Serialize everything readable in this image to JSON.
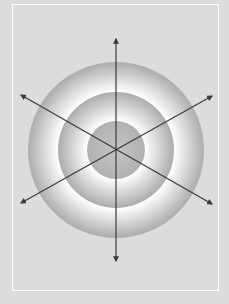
{
  "diagram": {
    "background_color": "#dcdcdc",
    "frame_color": "#ffffff",
    "ring_dark_color": "#a8a8a8",
    "ring_light_color": "#ffffff",
    "arrow_color": "#3a3a3a",
    "center": [
      116,
      150
    ],
    "rings": [
      {
        "name": "outer-ring",
        "radius": 88
      },
      {
        "name": "middle-ring",
        "radius": 58
      },
      {
        "name": "inner-circle",
        "radius": 29
      }
    ],
    "arrows": [
      {
        "name": "vertical-arrow",
        "from": [
          116,
          261
        ],
        "to": [
          116,
          39
        ]
      },
      {
        "name": "diagonal-arrow-1",
        "from": [
          21,
          95
        ],
        "to": [
          212,
          203
        ]
      },
      {
        "name": "diagonal-arrow-2",
        "from": [
          21,
          203
        ],
        "to": [
          212,
          96
        ]
      }
    ]
  }
}
